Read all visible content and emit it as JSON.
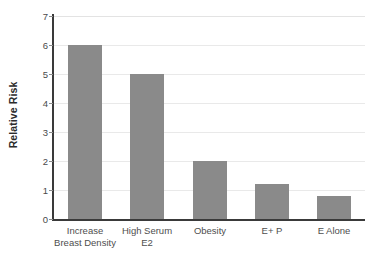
{
  "chart_data": {
    "type": "bar",
    "title": "",
    "xlabel": "",
    "ylabel": "Relative Risk",
    "categories": [
      "Increase Breast Density",
      "High Serum E2",
      "Obesity",
      "E+ P",
      "E Alone"
    ],
    "category_lines": [
      [
        "Increase",
        "Breast Density"
      ],
      [
        "High Serum",
        "E2"
      ],
      [
        "Obesity",
        ""
      ],
      [
        "E+ P",
        ""
      ],
      [
        "E Alone",
        ""
      ]
    ],
    "values": [
      6,
      5,
      2,
      1.2,
      0.8
    ],
    "ylim": [
      0,
      7
    ],
    "ytick_labels": [
      "7",
      "6",
      "5",
      "4",
      "3",
      "2",
      "1",
      "0"
    ],
    "ytick_values": [
      7,
      6,
      5,
      4,
      3,
      2,
      1,
      0
    ],
    "grid": true,
    "legend": false,
    "colors": {
      "bar_fill": "#8a8a8a",
      "gridline": "#e9e9e9",
      "axis_line": "#3a3a3a",
      "tick_label": "#4a4a4a",
      "axis_title": "#2b2b2b",
      "background": "#ffffff"
    }
  }
}
